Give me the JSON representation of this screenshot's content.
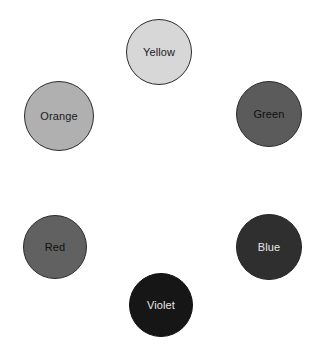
{
  "canvas": {
    "width": 315,
    "height": 351,
    "background": "#ffffff",
    "layout": "hexagonal color wheel arrangement, six labeled circles"
  },
  "swatches": [
    {
      "name": "yellow",
      "label": "Yellow",
      "fill": "#d7d7d7",
      "stroke": "#2b2b2b",
      "text_color": "#1a1a1a",
      "cx": 159,
      "cy": 52,
      "r": 33
    },
    {
      "name": "orange",
      "label": "Orange",
      "fill": "#b0b0b0",
      "stroke": "#2b2b2b",
      "text_color": "#1a1a1a",
      "cx": 59,
      "cy": 116,
      "r": 35
    },
    {
      "name": "green",
      "label": "Green",
      "fill": "#5b5b5b",
      "stroke": "#2b2b2b",
      "text_color": "#101010",
      "cx": 269,
      "cy": 114,
      "r": 33
    },
    {
      "name": "red",
      "label": "Red",
      "fill": "#616161",
      "stroke": "#2b2b2b",
      "text_color": "#101010",
      "cx": 55,
      "cy": 247,
      "r": 32
    },
    {
      "name": "blue",
      "label": "Blue",
      "fill": "#2f2f2f",
      "stroke": "#242424",
      "text_color": "#e8e8e8",
      "cx": 269,
      "cy": 247,
      "r": 33
    },
    {
      "name": "violet",
      "label": "Violet",
      "fill": "#161616",
      "stroke": "#121212",
      "text_color": "#e8e8e8",
      "cx": 161,
      "cy": 305,
      "r": 32
    }
  ]
}
